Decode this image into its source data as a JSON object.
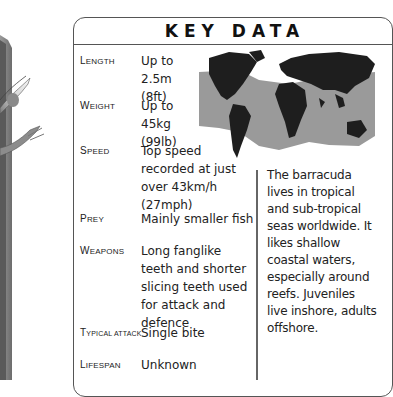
{
  "title": "KEY DATA",
  "facts": [
    {
      "label_cap": "L",
      "label_rest": "ength",
      "value": "Up to 2.5m (8ft)"
    },
    {
      "label_cap": "W",
      "label_rest": "eight",
      "value": "Up to 45kg (99lb)"
    },
    {
      "label_cap": "S",
      "label_rest": "peed",
      "value": "Top speed recorded at just over 43km/h (27mph)"
    },
    {
      "label_cap": "P",
      "label_rest": "rey",
      "value": "Mainly smaller fish"
    },
    {
      "label_cap": "W",
      "label_rest": "eapons",
      "value": "Long fanglike teeth and shorter slicing teeth used for attack and defence"
    },
    {
      "label_cap": "T",
      "label_rest": "ypical attack",
      "value": "Single bite"
    },
    {
      "label_cap": "L",
      "label_rest": "ifespan",
      "value": "Unknown"
    }
  ],
  "map": {
    "description": "World map showing barracuda distribution",
    "land_color": "#1e1e1e",
    "range_color": "#9a9a9a"
  },
  "habitat_text": "The barracuda lives in tropical and sub-tropical seas worldwide. It likes shallow coastal waters, especially around reefs. Juveniles live inshore, adults offshore."
}
